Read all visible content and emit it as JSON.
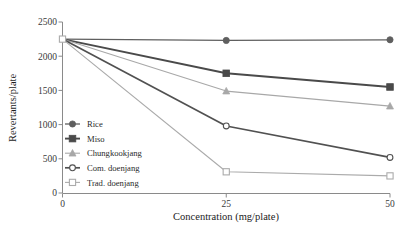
{
  "chart_data": {
    "type": "line",
    "title": "",
    "xlabel": "Concentration (mg/plate)",
    "ylabel": "Revertants/plate",
    "x": [
      0,
      25,
      50
    ],
    "xticklabels": [
      "0",
      "25",
      "50"
    ],
    "yticklabels": [
      "0",
      "500",
      "1000",
      "1500",
      "2000",
      "2500"
    ],
    "yticks": [
      0,
      500,
      1000,
      1500,
      2000,
      2500
    ],
    "xlim": [
      0,
      50
    ],
    "ylim": [
      0,
      2500
    ],
    "grid": false,
    "legend_position": "inner-lower-left",
    "series": [
      {
        "name": "Rice",
        "values": [
          2250,
          2230,
          2240
        ],
        "marker": "filled-circle",
        "color": "#5f5f5f",
        "linewidth": 1.3
      },
      {
        "name": "Miso",
        "values": [
          2250,
          1750,
          1550
        ],
        "marker": "filled-square",
        "color": "#4a4a4a",
        "linewidth": 1.9
      },
      {
        "name": "Chungkookjang",
        "values": [
          2250,
          1490,
          1270
        ],
        "marker": "filled-triangle",
        "color": "#a8a8a8",
        "linewidth": 1.1
      },
      {
        "name": "Com. doenjang",
        "values": [
          2250,
          980,
          520
        ],
        "marker": "open-circle",
        "color": "#515151",
        "linewidth": 1.7
      },
      {
        "name": "Trad. doenjang",
        "values": [
          2250,
          310,
          250
        ],
        "marker": "open-square",
        "color": "#ababab",
        "linewidth": 1.1
      }
    ]
  },
  "legend": {
    "items": [
      {
        "label": "Rice"
      },
      {
        "label": "Miso"
      },
      {
        "label": "Chungkookjang"
      },
      {
        "label": "Com. doenjang"
      },
      {
        "label": "Trad. doenjang"
      }
    ]
  },
  "axes": {
    "x_title": "Concentration (mg/plate)",
    "y_title": "Revertants/plate"
  }
}
